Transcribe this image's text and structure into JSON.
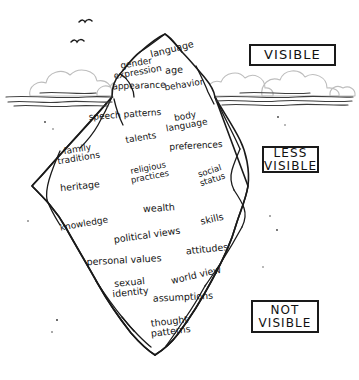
{
  "colors": {
    "ink": "#141414",
    "line": "#1a1a1a",
    "cloud": "#b9b9b9",
    "water": "#4a4a4a",
    "background": "#ffffff"
  },
  "legend": {
    "visible": {
      "lines": [
        "VISIBLE"
      ]
    },
    "less_visible": {
      "lines": [
        "LESS",
        "VISIBLE"
      ]
    },
    "not_visible": {
      "lines": [
        "NOT",
        "VISIBLE"
      ]
    }
  },
  "scene": {
    "birds": 2,
    "waterline_y": 97,
    "peak": {
      "x": 165,
      "y": 34
    },
    "bottom_tip": {
      "x": 155,
      "y": 355
    }
  },
  "labels": {
    "above_water": [
      {
        "id": "language",
        "lines": [
          "language"
        ],
        "x": 172,
        "y": 49,
        "size": 9.5,
        "rot": -14
      },
      {
        "id": "gender-expression",
        "lines": [
          "gender",
          "expression"
        ],
        "x": 137,
        "y": 68,
        "size": 9,
        "rot": -10
      },
      {
        "id": "age",
        "lines": [
          "age"
        ],
        "x": 174,
        "y": 70,
        "size": 9.5,
        "rot": -3
      },
      {
        "id": "appearance",
        "lines": [
          "appearance"
        ],
        "x": 139,
        "y": 86,
        "size": 9,
        "rot": -2
      },
      {
        "id": "behavior",
        "lines": [
          "behavior"
        ],
        "x": 184,
        "y": 85,
        "size": 9,
        "rot": -9
      }
    ],
    "below_water": [
      {
        "id": "speech-patterns",
        "lines": [
          "speech patterns"
        ],
        "x": 125,
        "y": 115,
        "size": 9,
        "rot": -4
      },
      {
        "id": "body-language",
        "lines": [
          "body",
          "language"
        ],
        "x": 186,
        "y": 121,
        "size": 9,
        "rot": -10
      },
      {
        "id": "talents",
        "lines": [
          "talents"
        ],
        "x": 141,
        "y": 138,
        "size": 9,
        "rot": -9
      },
      {
        "id": "preferences",
        "lines": [
          "preferences"
        ],
        "x": 196,
        "y": 146,
        "size": 9,
        "rot": -3
      },
      {
        "id": "family-traditions",
        "lines": [
          "family",
          "traditions"
        ],
        "x": 78,
        "y": 154,
        "size": 9,
        "rot": -9
      },
      {
        "id": "religious-practices",
        "lines": [
          "religious",
          "practices"
        ],
        "x": 149,
        "y": 172,
        "size": 8.5,
        "rot": -11
      },
      {
        "id": "social-status",
        "lines": [
          "social",
          "status"
        ],
        "x": 211,
        "y": 175,
        "size": 8.5,
        "rot": -18
      },
      {
        "id": "heritage",
        "lines": [
          "heritage"
        ],
        "x": 80,
        "y": 186,
        "size": 9.5,
        "rot": -6
      },
      {
        "id": "wealth",
        "lines": [
          "wealth"
        ],
        "x": 159,
        "y": 208,
        "size": 9.5,
        "rot": -4
      },
      {
        "id": "skills",
        "lines": [
          "skills"
        ],
        "x": 212,
        "y": 219,
        "size": 9.5,
        "rot": -13
      },
      {
        "id": "knowledge",
        "lines": [
          "knowledge"
        ],
        "x": 84,
        "y": 224,
        "size": 9,
        "rot": -10
      },
      {
        "id": "political-views",
        "lines": [
          "political views"
        ],
        "x": 147,
        "y": 235,
        "size": 9.5,
        "rot": -8
      },
      {
        "id": "attitudes",
        "lines": [
          "attitudes"
        ],
        "x": 207,
        "y": 249,
        "size": 9.5,
        "rot": -6
      },
      {
        "id": "personal-values",
        "lines": [
          "personal values"
        ],
        "x": 124,
        "y": 260,
        "size": 9.5,
        "rot": -3
      },
      {
        "id": "world-view",
        "lines": [
          "world view"
        ],
        "x": 196,
        "y": 275,
        "size": 9.5,
        "rot": -13
      },
      {
        "id": "sexual-identity",
        "lines": [
          "sexual",
          "identity"
        ],
        "x": 130,
        "y": 287,
        "size": 9.5,
        "rot": -6
      },
      {
        "id": "assumptions",
        "lines": [
          "assumptions"
        ],
        "x": 183,
        "y": 297,
        "size": 9.5,
        "rot": -3
      },
      {
        "id": "thought-patterns",
        "lines": [
          "thought",
          "patterns"
        ],
        "x": 170,
        "y": 326,
        "size": 9.5,
        "rot": -7
      }
    ]
  }
}
